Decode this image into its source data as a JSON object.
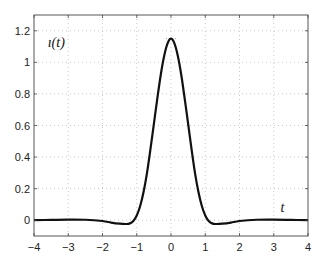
{
  "chart_data": {
    "type": "line",
    "title": "",
    "xlabel": "",
    "ylabel": "",
    "xlim": [
      -4,
      4
    ],
    "ylim": [
      -0.1,
      1.3
    ],
    "grid": true,
    "x_ticks": [
      -4,
      -3,
      -2,
      -1,
      0,
      1,
      2,
      3,
      4
    ],
    "x_tick_labels": [
      "−4",
      "−3",
      "−2",
      "−1",
      "0",
      "1",
      "2",
      "3",
      "4"
    ],
    "y_ticks": [
      0,
      0.2,
      0.4,
      0.6,
      0.8,
      1,
      1.2
    ],
    "y_tick_labels": [
      "0",
      "0.2",
      "0.4",
      "0.6",
      "0.8",
      "1",
      "1.2"
    ],
    "annotations": [
      {
        "text": "ı(t)",
        "x": -3.6,
        "y": 1.1
      },
      {
        "text": "t",
        "x": 3.2,
        "y": 0.05
      }
    ],
    "series": [
      {
        "name": "ı(t)",
        "color": "#111111",
        "x": [
          -4,
          -3.5,
          -3,
          -2.5,
          -2,
          -1.75,
          -1.5,
          -1.3,
          -1.2,
          -1.1,
          -1.0,
          -0.9,
          -0.8,
          -0.7,
          -0.6,
          -0.5,
          -0.4,
          -0.3,
          -0.2,
          -0.1,
          0,
          0.1,
          0.2,
          0.3,
          0.4,
          0.5,
          0.6,
          0.7,
          0.8,
          0.9,
          1.0,
          1.1,
          1.2,
          1.3,
          1.5,
          1.75,
          2,
          2.5,
          3,
          3.5,
          4
        ],
        "values": [
          0,
          0.002,
          0.004,
          0.003,
          -0.005,
          -0.015,
          -0.022,
          -0.024,
          -0.02,
          -0.005,
          0.03,
          0.09,
          0.18,
          0.3,
          0.45,
          0.61,
          0.77,
          0.92,
          1.04,
          1.12,
          1.15,
          1.12,
          1.04,
          0.92,
          0.77,
          0.61,
          0.45,
          0.3,
          0.18,
          0.09,
          0.03,
          -0.005,
          -0.02,
          -0.024,
          -0.022,
          -0.015,
          -0.005,
          0.003,
          0.004,
          0.002,
          0
        ]
      }
    ],
    "reference_marks": [
      {
        "type": "dotted_segment",
        "y": 1.15,
        "x_range": [
          -0.15,
          0.15
        ]
      }
    ]
  }
}
